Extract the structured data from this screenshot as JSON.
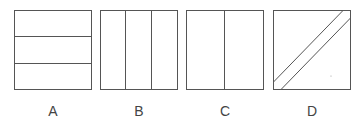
{
  "figure": {
    "stroke_color": "#555555",
    "options": [
      {
        "label": "A",
        "division": "three horizontal strips"
      },
      {
        "label": "B",
        "division": "three vertical strips"
      },
      {
        "label": "C",
        "division": "two vertical halves"
      },
      {
        "label": "D",
        "division": "diagonal band from upper-right to lower-left"
      }
    ]
  }
}
